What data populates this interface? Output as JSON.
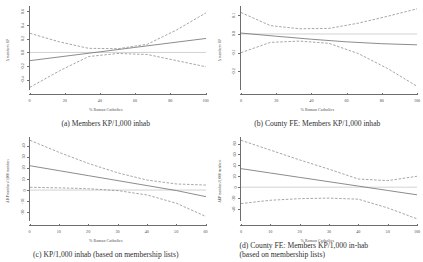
{
  "figure": {
    "panel_count": 4,
    "line_colors": {
      "fit": "#6f6f6f",
      "ci": "#8f8f8f",
      "zero": "#b4b4b4",
      "axis": "#6e6e6e"
    }
  },
  "chart_data": [
    {
      "type": "line",
      "panel": "a",
      "title": "(a) Members KP/1,000 inhab",
      "xlabel": "% Roman Catholics",
      "ylabel": "Δ members KP",
      "xlim": [
        0,
        100
      ],
      "ylim": [
        -0.55,
        0.68
      ],
      "xticks": [
        0,
        20,
        40,
        60,
        80,
        100
      ],
      "ytick_labels": [
        "0.6",
        "0.4",
        "0.2",
        "0.0",
        "-0.2",
        "-0.4"
      ],
      "yticks": [
        0.6,
        0.4,
        0.2,
        0.0,
        -0.2,
        -0.4
      ],
      "grid": false,
      "legend": "none",
      "zero_line": 0.0,
      "series": [
        {
          "name": "fit",
          "style": "solid",
          "x": [
            0,
            20,
            40,
            60,
            80,
            100
          ],
          "values": [
            -0.12,
            -0.055,
            0.01,
            0.075,
            0.14,
            0.205
          ]
        },
        {
          "name": "ci_upper",
          "style": "dashed",
          "x": [
            0,
            20,
            40,
            50,
            60,
            80,
            100
          ],
          "values": [
            0.28,
            0.155,
            0.06,
            0.055,
            0.12,
            0.33,
            0.58
          ]
        },
        {
          "name": "ci_lower",
          "style": "dashed",
          "x": [
            0,
            20,
            40,
            50,
            60,
            80,
            100
          ],
          "values": [
            -0.51,
            -0.27,
            -0.06,
            -0.015,
            -0.03,
            -0.12,
            -0.21
          ]
        }
      ]
    },
    {
      "type": "line",
      "panel": "b",
      "title": "(b) County FE: Members KP/1,000 inhab",
      "xlabel": "% Roman Catholics",
      "ylabel": "Δ members KP",
      "xlim": [
        0,
        100
      ],
      "ylim": [
        -0.3,
        0.15
      ],
      "xticks": [
        0,
        20,
        40,
        60,
        80,
        100
      ],
      "ytick_labels": [
        "0.1",
        "0.0",
        "-0.1",
        "-0.2"
      ],
      "yticks": [
        0.1,
        0.0,
        -0.1,
        -0.2
      ],
      "grid": false,
      "legend": "none",
      "zero_line": 0.0,
      "series": [
        {
          "name": "fit",
          "style": "solid",
          "x": [
            0,
            20,
            40,
            60,
            80,
            100
          ],
          "values": [
            0.005,
            -0.012,
            -0.028,
            -0.042,
            -0.052,
            -0.058
          ]
        },
        {
          "name": "ci_upper",
          "style": "dashed",
          "x": [
            0,
            20,
            30,
            40,
            60,
            80,
            100
          ],
          "values": [
            0.115,
            0.045,
            0.028,
            0.03,
            0.058,
            0.095,
            0.135
          ]
        },
        {
          "name": "ci_lower",
          "style": "dashed",
          "x": [
            0,
            20,
            30,
            40,
            60,
            80,
            100
          ],
          "values": [
            -0.1,
            -0.045,
            -0.038,
            -0.05,
            -0.105,
            -0.185,
            -0.28
          ]
        }
      ]
    },
    {
      "type": "line",
      "panel": "c",
      "title": "(c) KP/1,000 inhab (based on membership lists)",
      "xlabel": "% Roman Catholics",
      "ylabel": "Δ KP members/1,000 members",
      "xlim": [
        0,
        60
      ],
      "ylim": [
        -28,
        48
      ],
      "xticks": [
        0,
        10,
        20,
        30,
        40,
        50,
        60
      ],
      "ytick_labels": [
        "40",
        "30",
        "20",
        "10",
        "0",
        "-10",
        "-20"
      ],
      "yticks": [
        40,
        30,
        20,
        10,
        0,
        -10,
        -20
      ],
      "grid": false,
      "legend": "none",
      "zero_line": 0,
      "series": [
        {
          "name": "fit",
          "style": "solid",
          "x": [
            0,
            10,
            20,
            30,
            40,
            50,
            60
          ],
          "values": [
            22,
            17.5,
            13,
            8.5,
            4,
            -0.5,
            -6
          ]
        },
        {
          "name": "ci_upper",
          "style": "dashed",
          "x": [
            0,
            10,
            20,
            30,
            40,
            50,
            60
          ],
          "values": [
            45,
            34,
            24,
            15.5,
            9,
            5.5,
            4.5
          ]
        },
        {
          "name": "ci_lower",
          "style": "dashed",
          "x": [
            0,
            10,
            20,
            30,
            40,
            50,
            60
          ],
          "values": [
            2.5,
            2.0,
            1.2,
            -0.5,
            -4.5,
            -12,
            -24
          ]
        }
      ]
    },
    {
      "type": "line",
      "panel": "d",
      "title": "(d) County FE: Members KP/1,000 in-hab",
      "title_line2": "(based on membership lists)",
      "xlabel": "% Roman Catholics",
      "ylabel": "ΔKP members/1,000 members",
      "xlim": [
        0,
        60
      ],
      "ylim": [
        -62,
        92
      ],
      "xticks": [
        0,
        10,
        20,
        30,
        40,
        50,
        100
      ],
      "ytick_labels": [
        "80",
        "60",
        "40",
        "20",
        "0",
        "-20",
        "-40"
      ],
      "yticks": [
        80,
        60,
        40,
        20,
        0,
        -20,
        -40
      ],
      "grid": false,
      "legend": "none",
      "zero_line": 0,
      "series": [
        {
          "name": "fit",
          "style": "solid",
          "x": [
            0,
            10,
            20,
            30,
            40,
            50,
            60
          ],
          "values": [
            34,
            26,
            18,
            10,
            2,
            -6,
            -14
          ]
        },
        {
          "name": "ci_upper",
          "style": "dashed",
          "x": [
            0,
            10,
            20,
            30,
            40,
            50,
            60
          ],
          "values": [
            86,
            68,
            50,
            33,
            15,
            12,
            20
          ]
        },
        {
          "name": "ci_lower",
          "style": "dashed",
          "x": [
            0,
            10,
            20,
            30,
            40,
            50,
            60
          ],
          "values": [
            -30,
            -24,
            -21,
            -20,
            -22,
            -38,
            -58
          ]
        }
      ]
    }
  ]
}
